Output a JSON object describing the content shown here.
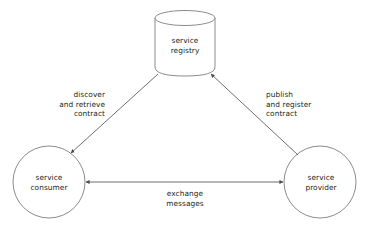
{
  "diagram": {
    "background_color": "#ffffff",
    "stroke_color": "#6d6e71",
    "text_color": "#231f20",
    "nodes": [
      {
        "id": "registry",
        "shape": "cylinder",
        "label_line1": "service",
        "label_line2": "registry"
      },
      {
        "id": "consumer",
        "shape": "circle",
        "label_line1": "service",
        "label_line2": "consumer"
      },
      {
        "id": "provider",
        "shape": "circle",
        "label_line1": "service",
        "label_line2": "provider"
      }
    ],
    "edges": [
      {
        "id": "discover",
        "from": "registry",
        "to": "consumer",
        "arrow": "single",
        "label_line1": "discover",
        "label_line2": "and retrieve",
        "label_line3": "contract"
      },
      {
        "id": "publish",
        "from": "provider",
        "to": "registry",
        "arrow": "single",
        "label_line1": "publish",
        "label_line2": "and register",
        "label_line3": "contract"
      },
      {
        "id": "exchange",
        "from": "consumer",
        "to": "provider",
        "arrow": "double",
        "label_line1": "exchange",
        "label_line2": "messages"
      }
    ]
  }
}
